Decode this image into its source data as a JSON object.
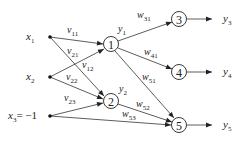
{
  "diagram": {
    "type": "neural-network",
    "inputs": [
      {
        "id": "x1",
        "base": "x",
        "sub": "1",
        "suffix": ""
      },
      {
        "id": "x2",
        "base": "x",
        "sub": "2",
        "suffix": ""
      },
      {
        "id": "x3",
        "base": "x",
        "sub": "3",
        "suffix": "= −1"
      }
    ],
    "hidden": [
      {
        "id": "1",
        "label": "1",
        "out": {
          "base": "y",
          "sub": "1"
        }
      },
      {
        "id": "2",
        "label": "2",
        "out": {
          "base": "y",
          "sub": "2"
        }
      }
    ],
    "outputs": [
      {
        "id": "3",
        "label": "3",
        "out": {
          "base": "y",
          "sub": "3"
        }
      },
      {
        "id": "4",
        "label": "4",
        "out": {
          "base": "y",
          "sub": "4"
        }
      },
      {
        "id": "5",
        "label": "5",
        "out": {
          "base": "y",
          "sub": "5"
        }
      }
    ],
    "edges": [
      {
        "from": "x1",
        "to": "1",
        "w": "v",
        "sub": "11"
      },
      {
        "from": "x1",
        "to": "2",
        "w": "v",
        "sub": "21"
      },
      {
        "from": "x2",
        "to": "1",
        "w": "v",
        "sub": "12"
      },
      {
        "from": "x2",
        "to": "2",
        "w": "v",
        "sub": "22"
      },
      {
        "from": "x3",
        "to": "2",
        "w": "v",
        "sub": "23"
      },
      {
        "from": "1",
        "to": "3",
        "w": "w",
        "sub": "31"
      },
      {
        "from": "1",
        "to": "4",
        "w": "w",
        "sub": "41"
      },
      {
        "from": "1",
        "to": "5",
        "w": "w",
        "sub": "51"
      },
      {
        "from": "2",
        "to": "5",
        "w": "w",
        "sub": "52"
      },
      {
        "from": "x3",
        "to": "5",
        "w": "w",
        "sub": "53"
      }
    ]
  }
}
